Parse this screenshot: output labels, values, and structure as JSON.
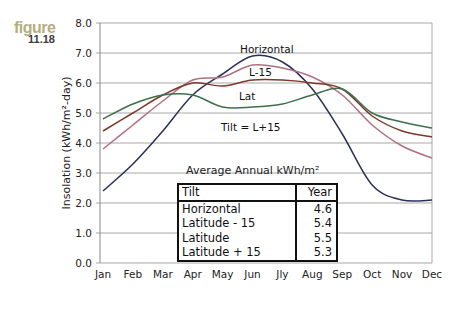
{
  "figure": {
    "word": "figure",
    "number": "11.18"
  },
  "chart_data": {
    "type": "line",
    "title": "",
    "xlabel": "",
    "ylabel": "Insolation (kWh/m²-day)",
    "ylim": [
      0,
      8
    ],
    "yticks": [
      "0.0",
      "1.0",
      "2.0",
      "3.0",
      "4.0",
      "5.0",
      "6.0",
      "7.0",
      "8.0"
    ],
    "grid": true,
    "categories": [
      "Jan",
      "Feb",
      "Mar",
      "Apr",
      "May",
      "Jun",
      "Jly",
      "Aug",
      "Sep",
      "Oct",
      "Nov",
      "Dec"
    ],
    "series": [
      {
        "name": "Horizontal",
        "color": "#2b2f5a",
        "values": [
          2.4,
          3.3,
          4.4,
          5.6,
          6.3,
          6.9,
          6.7,
          5.8,
          4.3,
          2.6,
          2.1,
          2.1
        ]
      },
      {
        "name": "L-15",
        "color": "#b0707f",
        "values": [
          3.8,
          4.6,
          5.4,
          6.1,
          6.2,
          6.6,
          6.5,
          6.2,
          5.6,
          4.6,
          3.9,
          3.5
        ]
      },
      {
        "name": "Lat",
        "color": "#7a3a2a",
        "values": [
          4.4,
          5.0,
          5.6,
          6.0,
          5.9,
          6.1,
          6.1,
          6.0,
          5.8,
          4.9,
          4.4,
          4.2
        ]
      },
      {
        "name": "Tilt = L+15",
        "color": "#3f6e4c",
        "values": [
          4.8,
          5.3,
          5.6,
          5.6,
          5.2,
          5.2,
          5.3,
          5.6,
          5.8,
          5.0,
          4.7,
          4.5
        ]
      }
    ],
    "annotations": [
      "Horizontal",
      "L-15",
      "Lat",
      "Tilt = L+15"
    ],
    "inset_table": {
      "title": "Average Annual kWh/m²",
      "headers": [
        "Tilt",
        "Year"
      ],
      "rows": [
        [
          "Horizontal",
          "4.6"
        ],
        [
          "Latitude - 15",
          "5.4"
        ],
        [
          "Latitude",
          "5.5"
        ],
        [
          "Latitude + 15",
          "5.3"
        ]
      ]
    }
  }
}
